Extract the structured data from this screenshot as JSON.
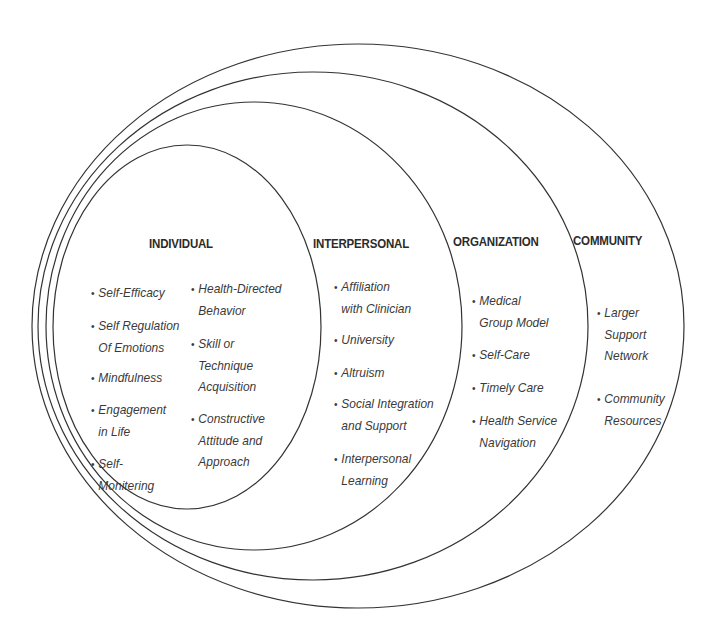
{
  "diagram": {
    "type": "nested-ellipses",
    "stroke_color": "#333333",
    "background": "#ffffff",
    "levels": [
      {
        "key": "community",
        "heading": "COMMUNITY",
        "ellipse": {
          "cx": 358,
          "cy": 326,
          "rx": 326,
          "ry": 282
        },
        "items": [
          {
            "lines": [
              "Larger",
              "Support",
              "Network"
            ]
          },
          {
            "lines": [
              "Community",
              "Resources"
            ]
          }
        ]
      },
      {
        "key": "organization",
        "heading": "ORGANIZATION",
        "ellipse": {
          "cx": 313,
          "cy": 326,
          "rx": 275,
          "ry": 254
        },
        "items": [
          {
            "lines": [
              "Medical",
              "Group Model"
            ]
          },
          {
            "lines": [
              "Self-Care"
            ]
          },
          {
            "lines": [
              "Timely Care"
            ]
          },
          {
            "lines": [
              "Health Service",
              "Navigation"
            ]
          }
        ]
      },
      {
        "key": "interpersonal",
        "heading": "INTERPERSONAL",
        "ellipse": {
          "cx": 254,
          "cy": 326,
          "rx": 208,
          "ry": 224
        },
        "items": [
          {
            "lines": [
              "Affiliation",
              "with  Clinician"
            ]
          },
          {
            "lines": [
              "University"
            ]
          },
          {
            "lines": [
              "Altruism"
            ]
          },
          {
            "lines": [
              "Social Integration",
              "and Support"
            ]
          },
          {
            "lines": [
              "Interpersonal",
              "Learning"
            ]
          }
        ]
      },
      {
        "key": "individual",
        "heading": "INDIVIDUAL",
        "ellipse": {
          "cx": 187,
          "cy": 327,
          "rx": 134,
          "ry": 182
        },
        "items_left": [
          {
            "lines": [
              "Self-Efficacy"
            ]
          },
          {
            "lines": [
              "Self Regulation",
              "Of Emotions"
            ]
          },
          {
            "lines": [
              "Mindfulness"
            ]
          },
          {
            "lines": [
              "Engagement",
              "in Life"
            ]
          },
          {
            "lines": [
              "Self-",
              "Monitering"
            ]
          }
        ],
        "items_right": [
          {
            "lines": [
              "Health-Directed",
              "Behavior"
            ]
          },
          {
            "lines": [
              "Skill or",
              "Technique",
              "Acquisition"
            ]
          },
          {
            "lines": [
              "Constructive",
              "Attitude and",
              "Approach"
            ]
          }
        ]
      }
    ],
    "bullet_glyph": "•"
  }
}
